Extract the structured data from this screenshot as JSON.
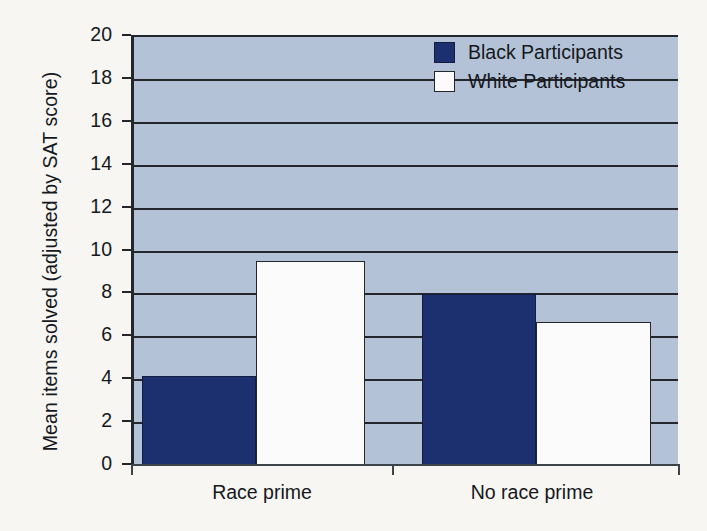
{
  "chart_data": {
    "type": "bar",
    "title": "",
    "xlabel": "",
    "ylabel": "Mean items solved (adjusted by SAT score)",
    "categories": [
      "Race prime",
      "No race prime"
    ],
    "series": [
      {
        "name": "Black Participants",
        "color": "#1c2f6e",
        "values": [
          4.2,
          8.0
        ]
      },
      {
        "name": "White Participants",
        "color": "#ffffff",
        "values": [
          9.55,
          6.7
        ]
      }
    ],
    "ylim": [
      0,
      20
    ],
    "ytick_labels": [
      "0",
      "2",
      "4",
      "6",
      "8",
      "10",
      "12",
      "14",
      "16",
      "18",
      "20"
    ],
    "ytick_values": [
      0,
      2,
      4,
      6,
      8,
      10,
      12,
      14,
      16,
      18,
      20
    ],
    "grid": true,
    "grid_axis": "y",
    "legend_position": "top-right",
    "plot_background": "#b3c2d7",
    "figure_background": "#f7f6f2",
    "axis_color": "#23272c"
  },
  "legend": {
    "entries": [
      {
        "label": "Black Participants",
        "swatch": "black"
      },
      {
        "label": "White Participants",
        "swatch": "white"
      }
    ]
  }
}
